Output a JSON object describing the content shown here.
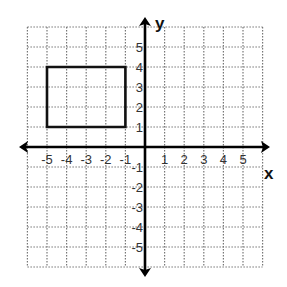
{
  "chart_data": {
    "type": "coordinate-plane",
    "title": "",
    "xlabel": "x",
    "ylabel": "y",
    "xlim": [
      -6,
      6
    ],
    "ylim": [
      -6,
      6
    ],
    "grid": true,
    "grid_style": "dotted",
    "x_ticks": [
      "-5",
      "-4",
      "-3",
      "-2",
      "-1",
      "1",
      "2",
      "3",
      "4",
      "5"
    ],
    "y_ticks": [
      "5",
      "4",
      "3",
      "2",
      "1",
      "-1",
      "-2",
      "-3",
      "-4",
      "-5"
    ],
    "shapes": [
      {
        "type": "rectangle",
        "vertices": [
          [
            -5,
            1
          ],
          [
            -1,
            1
          ],
          [
            -1,
            4
          ],
          [
            -5,
            4
          ]
        ],
        "stroke": "#000000"
      }
    ]
  },
  "labels": {
    "x_axis": "x",
    "y_axis": "y"
  },
  "colors": {
    "grid": "#777777",
    "axis": "#000000",
    "shape": "#111111"
  }
}
